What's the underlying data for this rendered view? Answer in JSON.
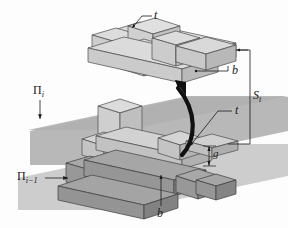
{
  "figure": {
    "type": "isometric-technical-diagram",
    "colors": {
      "plane_upper": "#b4b4b4",
      "plane_lower": "#c9c9c9",
      "block_light_top": "#dcdcdc",
      "block_light_side": "#c4c4c4",
      "block_light_front": "#d0d0d0",
      "block_dark_top": "#a8a8a8",
      "block_dark_side": "#8f8f8f",
      "block_dark_front": "#9c9c9c",
      "outline": "#4a4a4a",
      "arrow": "#111111",
      "leader": "#222222",
      "text": "#1a1a1a",
      "background": "#fdfdfd"
    }
  },
  "labels": {
    "t_top": {
      "text": "t",
      "role": "thickness-label-upper-assembly"
    },
    "b_top": {
      "text": "b",
      "role": "width-label-upper-assembly"
    },
    "s_t": {
      "text": "S",
      "sub": "t",
      "role": "separation-distance-label"
    },
    "t_mid": {
      "text": "t",
      "role": "thickness-label-lower-assembly"
    },
    "g": {
      "text": "g",
      "role": "gap-label"
    },
    "b_bottom": {
      "text": "b",
      "role": "width-label-lower-assembly"
    },
    "plane_i": {
      "text": "Π",
      "sub": "i",
      "role": "plane-label-upper"
    },
    "plane_i_minus_1": {
      "text": "Π",
      "sub": "i−1",
      "role": "plane-label-lower"
    }
  },
  "annotations": {
    "lift_arrow": "curved-upward-arrow",
    "plane_i_arrow": "down-arrow",
    "plane_i_minus_1_arrow": "right-arrow",
    "g_arrow": "vertical-double-arrow"
  }
}
